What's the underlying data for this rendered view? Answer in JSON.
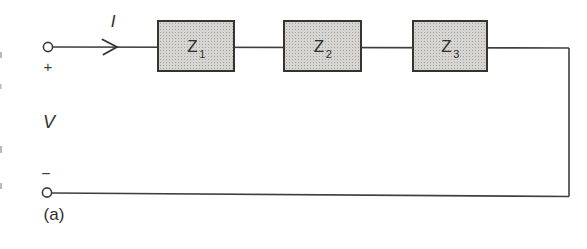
{
  "diagram": {
    "type": "series-impedance-circuit",
    "caption": "(a)",
    "labels": {
      "current": "I",
      "voltage": "V",
      "plus": "+",
      "minus": "−"
    },
    "impedances": [
      {
        "label": "Z",
        "sub": "1"
      },
      {
        "label": "Z",
        "sub": "2"
      },
      {
        "label": "Z",
        "sub": "3"
      }
    ],
    "colors": {
      "background": "#ffffff",
      "wire": "#3e3e3c",
      "box_border": "#35342f",
      "box_fill_base": "#d6d5d2",
      "box_fill_dots": "#a3a29e",
      "text": "#2f2e2c"
    }
  }
}
